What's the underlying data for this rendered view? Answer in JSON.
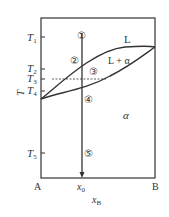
{
  "diagram": {
    "y_axis_label": "T",
    "x_axis_label": "x",
    "x_axis_label_sub": "B",
    "x_left_label": "A",
    "x_right_label": "B",
    "x0_label": "x",
    "x0_sub": "0",
    "temperatures": [
      {
        "label": "T",
        "sub": "1",
        "y": 37
      },
      {
        "label": "T",
        "sub": "2",
        "y": 69
      },
      {
        "label": "T",
        "sub": "3",
        "y": 79
      },
      {
        "label": "T",
        "sub": "4",
        "y": 91
      },
      {
        "label": "T",
        "sub": "5",
        "y": 153
      }
    ],
    "regions": {
      "liquid": "L",
      "two_phase": "L + α",
      "solid": "α"
    },
    "points": [
      "①",
      "②",
      "③",
      "④",
      "⑤"
    ],
    "colors": {
      "line": "#333333",
      "text": "#333333",
      "background": "#ffffff"
    }
  }
}
